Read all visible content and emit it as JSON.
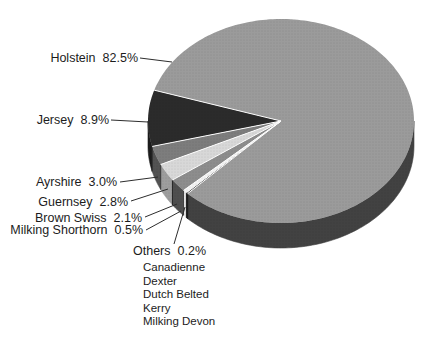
{
  "figure": {
    "kind": "3d-pie-chart-scan",
    "background": "#ffffff",
    "text_color": "#1c1c1c",
    "leader_line_color": "#2d2d2d"
  },
  "chart_data": {
    "type": "pie",
    "title": "",
    "unit": "%",
    "legend_position": "labels-with-leader-lines",
    "grid": false,
    "slices": [
      {
        "label": "Holstein",
        "value": 82.5,
        "pct_label": "82.5%",
        "color": "#9b9b9b",
        "side_color": "#424242"
      },
      {
        "label": "Jersey",
        "value": 8.9,
        "pct_label": "8.9%",
        "color": "#2b2b2b",
        "side_color": "#1c1c1c"
      },
      {
        "label": "Ayrshire",
        "value": 3.0,
        "pct_label": "3.0%",
        "color": "#7d7d7d",
        "side_color": "#535353"
      },
      {
        "label": "Guernsey",
        "value": 2.8,
        "pct_label": "2.8%",
        "color": "#d8d8d8",
        "side_color": "#9e9e9e"
      },
      {
        "label": "Brown Swiss",
        "value": 2.1,
        "pct_label": "2.1%",
        "color": "#8d8d8d",
        "side_color": "#4f4f4f"
      },
      {
        "label": "Milking Shorthorn",
        "value": 0.5,
        "pct_label": "0.5%",
        "color": "#f3f3f3",
        "side_color": "#ececec"
      },
      {
        "label": "Others",
        "value": 0.2,
        "pct_label": "0.2%",
        "color": "#373737",
        "side_color": "#171717"
      }
    ],
    "others_breakdown": [
      "Canadienne",
      "Dexter",
      "Dutch Belted",
      "Kerry",
      "Milking Devon"
    ]
  }
}
